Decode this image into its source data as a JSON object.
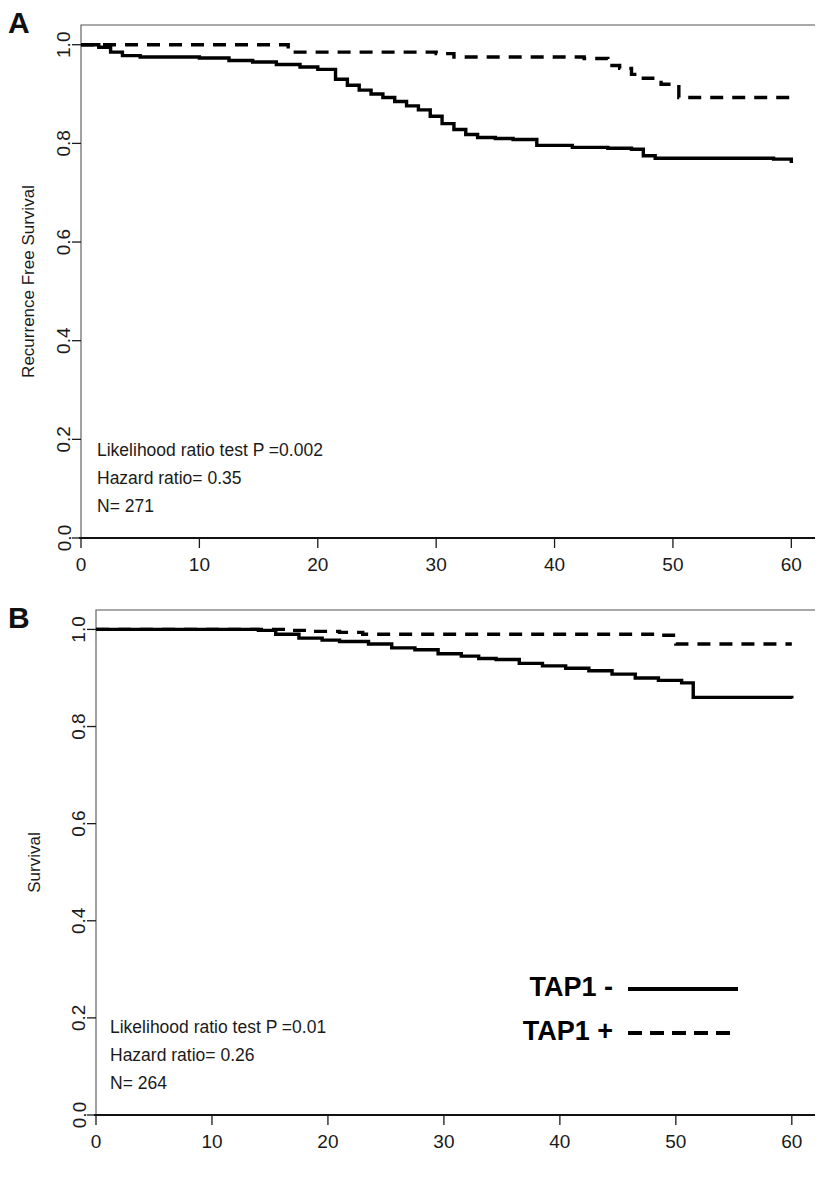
{
  "figure": {
    "xlabel": "Time (months)",
    "legend": {
      "items": [
        {
          "label": "TAP1 -",
          "style": "solid"
        },
        {
          "label": "TAP1 +",
          "style": "dashed"
        }
      ]
    }
  },
  "panels": [
    {
      "letter": "A",
      "ylabel": "Recurrence Free Survival",
      "annotations": {
        "line1": "Likelihood ratio test P =0.002",
        "line2": "Hazard ratio= 0.35",
        "line3": "N= 271"
      }
    },
    {
      "letter": "B",
      "ylabel": "Survival",
      "annotations": {
        "line1": "Likelihood ratio test P =0.01",
        "line2": "Hazard ratio= 0.26",
        "line3": "N= 264"
      }
    }
  ],
  "chart_data": [
    {
      "type": "line",
      "subtype": "kaplan-meier-step",
      "panel": "A",
      "title": "",
      "xlabel": "Time (months)",
      "ylabel": "Recurrence Free Survival",
      "xlim": [
        0,
        62
      ],
      "ylim": [
        0.0,
        1.04
      ],
      "xticks": [
        0,
        10,
        20,
        30,
        40,
        50,
        60
      ],
      "xticklabels": [
        "0",
        "10",
        "20",
        "30",
        "40",
        "50",
        "60"
      ],
      "yticks": [
        0.0,
        0.2,
        0.4,
        0.6,
        0.8,
        1.0
      ],
      "yticklabels": [
        "0.0",
        "0.2",
        "0.4",
        "0.6",
        "0.8",
        "1.0"
      ],
      "grid": false,
      "legend_position": "none",
      "annotations": [
        "Likelihood ratio test P =0.002",
        "Hazard ratio= 0.35",
        "N= 271"
      ],
      "series": [
        {
          "name": "TAP1 -",
          "style": "solid",
          "x": [
            0,
            1.5,
            2.5,
            3.5,
            5.0,
            10.0,
            12.5,
            14.5,
            16.5,
            18.5,
            20.0,
            21.5,
            22.5,
            23.5,
            24.5,
            25.5,
            26.5,
            27.5,
            28.5,
            29.5,
            30.5,
            31.5,
            32.5,
            33.5,
            35.0,
            36.5,
            38.5,
            41.5,
            44.5,
            46.5,
            47.5,
            48.5,
            58.5,
            60.0
          ],
          "y": [
            1.0,
            0.995,
            0.985,
            0.978,
            0.975,
            0.973,
            0.968,
            0.965,
            0.96,
            0.955,
            0.95,
            0.93,
            0.918,
            0.908,
            0.9,
            0.893,
            0.885,
            0.876,
            0.868,
            0.855,
            0.84,
            0.828,
            0.818,
            0.812,
            0.81,
            0.808,
            0.796,
            0.792,
            0.79,
            0.788,
            0.775,
            0.77,
            0.768,
            0.76
          ]
        },
        {
          "name": "TAP1 +",
          "style": "dashed",
          "x": [
            0,
            10.0,
            16.5,
            17.5,
            30.0,
            31.5,
            42.5,
            44.5,
            45.5,
            46.5,
            47.5,
            49.0,
            50.5,
            60.0
          ],
          "y": [
            1.0,
            1.0,
            1.0,
            0.985,
            0.982,
            0.975,
            0.972,
            0.958,
            0.952,
            0.94,
            0.932,
            0.92,
            0.893,
            0.893
          ]
        }
      ]
    },
    {
      "type": "line",
      "subtype": "kaplan-meier-step",
      "panel": "B",
      "title": "",
      "xlabel": "Time (months)",
      "ylabel": "Survival",
      "xlim": [
        0,
        62
      ],
      "ylim": [
        0.0,
        1.04
      ],
      "xticks": [
        0,
        10,
        20,
        30,
        40,
        50,
        60
      ],
      "xticklabels": [
        "0",
        "10",
        "20",
        "30",
        "40",
        "50",
        "60"
      ],
      "yticks": [
        0.0,
        0.2,
        0.4,
        0.6,
        0.8,
        1.0
      ],
      "yticklabels": [
        "0.0",
        "0.2",
        "0.4",
        "0.6",
        "0.8",
        "1.0"
      ],
      "grid": false,
      "legend_position": "lower-right",
      "annotations": [
        "Likelihood ratio test P =0.01",
        "Hazard ratio= 0.26",
        "N= 264"
      ],
      "series": [
        {
          "name": "TAP1 -",
          "style": "solid",
          "x": [
            0,
            14.0,
            15.5,
            17.5,
            19.5,
            21.0,
            23.5,
            25.5,
            27.5,
            29.5,
            31.5,
            33.0,
            34.5,
            36.5,
            38.5,
            40.5,
            42.5,
            44.5,
            46.5,
            48.5,
            50.5,
            51.5,
            60.0
          ],
          "y": [
            1.0,
            0.998,
            0.99,
            0.982,
            0.978,
            0.975,
            0.97,
            0.962,
            0.958,
            0.95,
            0.945,
            0.94,
            0.938,
            0.93,
            0.925,
            0.92,
            0.915,
            0.908,
            0.9,
            0.895,
            0.89,
            0.86,
            0.858
          ]
        },
        {
          "name": "TAP1 +",
          "style": "dashed",
          "x": [
            0,
            14.0,
            16.5,
            18.5,
            21.0,
            23.0,
            48.5,
            50.0,
            60.0
          ],
          "y": [
            1.0,
            1.0,
            0.998,
            0.996,
            0.994,
            0.99,
            0.988,
            0.97,
            0.97
          ]
        }
      ]
    }
  ]
}
